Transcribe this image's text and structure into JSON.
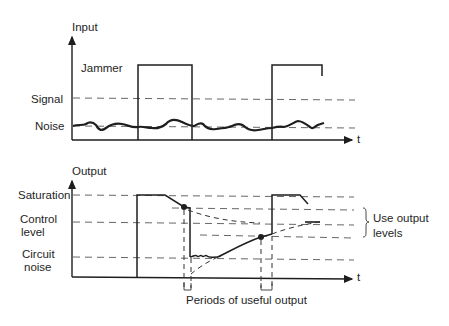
{
  "top_chart": {
    "y_axis_label": "Input",
    "x_axis_label": "t",
    "labels": {
      "jammer": "Jammer",
      "signal": "Signal",
      "noise": "Noise"
    }
  },
  "bottom_chart": {
    "y_axis_label": "Output",
    "x_axis_label": "t",
    "labels": {
      "saturation": "Saturation",
      "control_line1": "Control",
      "control_line2": "level",
      "circuit_line1": "Circuit",
      "circuit_line2": "noise",
      "use_line1": "Use output",
      "use_line2": "levels",
      "periods": "Periods of useful output"
    }
  },
  "colors": {
    "ink": "#1e1e1e",
    "background": "#ffffff"
  }
}
